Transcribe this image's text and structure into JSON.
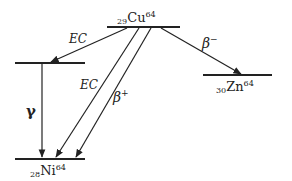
{
  "diagram": {
    "nuclides": {
      "parent": {
        "Z": "29",
        "symbol": "Cu",
        "A": "64"
      },
      "beta_minus_daughter": {
        "Z": "30",
        "symbol": "Zn",
        "A": "64"
      },
      "ec_daughter": {
        "Z": "28",
        "symbol": "Ni",
        "A": "64"
      }
    },
    "transitions": {
      "ec_excited": {
        "label": "EC"
      },
      "ec_ground": {
        "label": "EC"
      },
      "beta_plus": {
        "label": "β",
        "sup": "+"
      },
      "beta_minus": {
        "label": "β",
        "sup": "−"
      },
      "gamma": {
        "label": "γ"
      }
    },
    "colors": {
      "ink": "#222222",
      "background": "#ffffff"
    }
  }
}
